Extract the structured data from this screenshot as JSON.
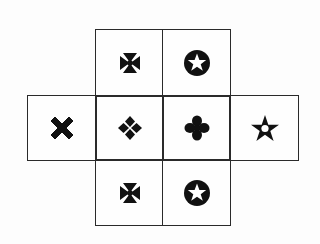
{
  "figure": {
    "type": "cube-net",
    "cells": [
      {
        "id": "top-left",
        "row": 0,
        "col": 1,
        "symbol": "maltese-cross",
        "glyph": "✠"
      },
      {
        "id": "top-right",
        "row": 0,
        "col": 2,
        "symbol": "circled-white-star",
        "glyph": "✪"
      },
      {
        "id": "mid-far-left",
        "row": 1,
        "col": 0,
        "symbol": "heavy-x",
        "glyph": "✖"
      },
      {
        "id": "mid-left",
        "row": 1,
        "col": 1,
        "symbol": "four-diamonds",
        "glyph": "❖"
      },
      {
        "id": "mid-right",
        "row": 1,
        "col": 2,
        "symbol": "four-lobes",
        "glyph": "✤"
      },
      {
        "id": "mid-far-right",
        "row": 1,
        "col": 3,
        "symbol": "black-center-white-star",
        "glyph": "✬"
      },
      {
        "id": "bottom-left",
        "row": 2,
        "col": 1,
        "symbol": "maltese-cross",
        "glyph": "✠"
      },
      {
        "id": "bottom-right",
        "row": 2,
        "col": 2,
        "symbol": "circled-white-star",
        "glyph": "✪"
      }
    ],
    "colors": {
      "line": "#2a2a2a",
      "symbol": "#111111",
      "background": "#fefefe"
    }
  }
}
